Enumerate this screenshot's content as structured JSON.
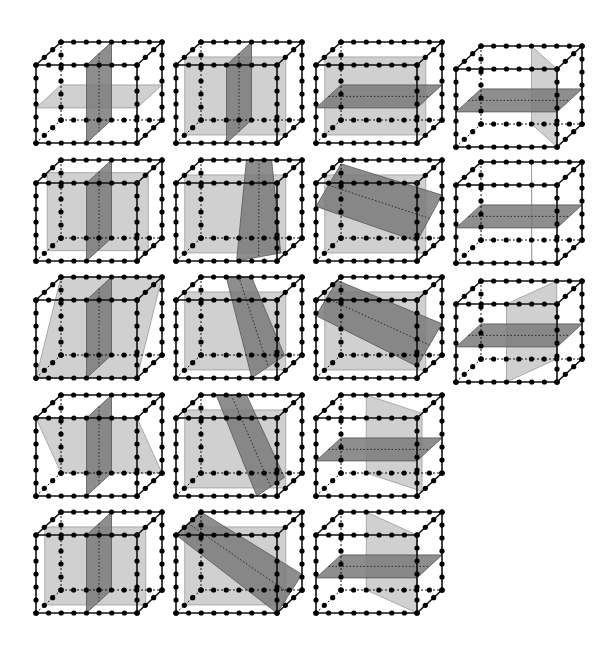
{
  "figure": {
    "colors": {
      "edge": "#111111",
      "bead": "#000000",
      "light_plane": "#c8c8c8",
      "dark_plane": "#7a7a7a",
      "background": "#ffffff"
    },
    "cube_geometry": {
      "front_width": 101,
      "front_height": 78,
      "depth_dx": 25,
      "depth_dy": -23,
      "beads_per_front_horizontal_edge": 9,
      "beads_per_vertical_edge": 7,
      "beads_per_depth_edge": 4
    },
    "cubes": [
      {
        "row": 0,
        "col": 0,
        "x": 36,
        "y": 65,
        "planes": [
          {
            "shade": "light",
            "pts": [
              [
                0,
                0.55,
                0
              ],
              [
                1,
                0.55,
                0
              ],
              [
                1,
                0.55,
                1
              ],
              [
                0,
                0.55,
                1
              ]
            ]
          },
          {
            "shade": "dark",
            "pts": [
              [
                0.5,
                0,
                0
              ],
              [
                0.5,
                1,
                0
              ],
              [
                0.5,
                1,
                1
              ],
              [
                0.5,
                0,
                1
              ]
            ]
          }
        ]
      },
      {
        "row": 0,
        "col": 1,
        "x": 176,
        "y": 65,
        "planes": [
          {
            "shade": "light",
            "pts": [
              [
                0,
                0,
                0.35
              ],
              [
                1,
                0,
                0.35
              ],
              [
                1,
                1,
                0.35
              ],
              [
                0,
                1,
                0.35
              ]
            ]
          },
          {
            "shade": "dark",
            "pts": [
              [
                0.5,
                0,
                0
              ],
              [
                0.5,
                1,
                0
              ],
              [
                0.5,
                1,
                1
              ],
              [
                0.5,
                0,
                1
              ]
            ]
          }
        ]
      },
      {
        "row": 0,
        "col": 2,
        "x": 316,
        "y": 65,
        "planes": [
          {
            "shade": "light",
            "pts": [
              [
                0,
                0,
                0.35
              ],
              [
                1,
                0,
                0.35
              ],
              [
                1,
                1,
                0.35
              ],
              [
                0,
                1,
                0.35
              ]
            ]
          },
          {
            "shade": "dark",
            "pts": [
              [
                0,
                0.55,
                0
              ],
              [
                1,
                0.55,
                0
              ],
              [
                1,
                0.55,
                1
              ],
              [
                0,
                0.55,
                1
              ]
            ]
          }
        ]
      },
      {
        "row": 0,
        "col": 3,
        "x": 456,
        "y": 69,
        "planes": [
          {
            "shade": "light",
            "pts": [
              [
                0.5,
                0,
                1
              ],
              [
                1,
                0,
                0
              ],
              [
                1,
                1,
                0
              ],
              [
                0.5,
                1,
                1
              ]
            ]
          },
          {
            "shade": "dark",
            "pts": [
              [
                0,
                0.55,
                0
              ],
              [
                1,
                0.55,
                0
              ],
              [
                1,
                0.55,
                1
              ],
              [
                0,
                0.55,
                1
              ]
            ]
          }
        ]
      },
      {
        "row": 1,
        "col": 0,
        "x": 36,
        "y": 183,
        "planes": [
          {
            "shade": "light",
            "pts": [
              [
                0,
                0,
                0.45
              ],
              [
                1,
                0,
                0.45
              ],
              [
                1,
                1,
                0.45
              ],
              [
                0,
                1,
                0.45
              ]
            ],
            "skew": "floor"
          },
          {
            "shade": "dark",
            "pts": [
              [
                0.5,
                0,
                0
              ],
              [
                0.5,
                1,
                0
              ],
              [
                0.5,
                1,
                1
              ],
              [
                0.5,
                0,
                1
              ]
            ]
          }
        ]
      },
      {
        "row": 1,
        "col": 1,
        "x": 176,
        "y": 183,
        "planes": [
          {
            "shade": "light",
            "pts": [
              [
                0,
                0,
                0.35
              ],
              [
                1,
                0,
                0.35
              ],
              [
                1,
                1,
                0.35
              ],
              [
                0,
                1,
                0.35
              ]
            ]
          },
          {
            "shade": "dark",
            "pts": [
              [
                0.45,
                0,
                1
              ],
              [
                0.6,
                1,
                0
              ],
              [
                0.95,
                1,
                0.35
              ],
              [
                0.7,
                0,
                1
              ]
            ]
          }
        ]
      },
      {
        "row": 1,
        "col": 2,
        "x": 316,
        "y": 183,
        "planes": [
          {
            "shade": "light",
            "pts": [
              [
                0,
                0,
                0.35
              ],
              [
                1,
                0,
                0.35
              ],
              [
                1,
                1,
                0.35
              ],
              [
                0,
                1,
                0.35
              ]
            ]
          },
          {
            "shade": "dark",
            "pts": [
              [
                0,
                0.3,
                0
              ],
              [
                1,
                0.75,
                0
              ],
              [
                1,
                0.45,
                1
              ],
              [
                0,
                0.05,
                1
              ]
            ]
          }
        ]
      },
      {
        "row": 1,
        "col": 3,
        "x": 456,
        "y": 185,
        "planes": [
          {
            "shade": "light",
            "pts": [
              [
                0.5,
                0,
                1
              ],
              [
                0.75,
                0,
                0
              ],
              [
                0.75,
                1,
                0
              ],
              [
                0.5,
                1,
                1
              ]
            ]
          },
          {
            "shade": "dark",
            "pts": [
              [
                0,
                0.55,
                0
              ],
              [
                1,
                0.55,
                0
              ],
              [
                1,
                0.55,
                1
              ],
              [
                0,
                0.55,
                1
              ]
            ]
          }
        ]
      },
      {
        "row": 2,
        "col": 0,
        "x": 36,
        "y": 300,
        "planes": [
          {
            "shade": "light",
            "pts": [
              [
                0,
                1,
                0
              ],
              [
                1,
                1,
                0
              ],
              [
                1,
                0,
                1
              ],
              [
                0,
                0,
                1
              ]
            ]
          },
          {
            "shade": "dark",
            "pts": [
              [
                0.5,
                0,
                0
              ],
              [
                0.5,
                1,
                0
              ],
              [
                0.5,
                1,
                1
              ],
              [
                0.5,
                0,
                1
              ]
            ]
          }
        ]
      },
      {
        "row": 2,
        "col": 1,
        "x": 176,
        "y": 300,
        "planes": [
          {
            "shade": "light",
            "pts": [
              [
                0,
                0,
                0.35
              ],
              [
                1,
                0,
                0.35
              ],
              [
                1,
                1,
                0.35
              ],
              [
                0,
                1,
                0.35
              ]
            ]
          },
          {
            "shade": "dark",
            "pts": [
              [
                0.25,
                0,
                1
              ],
              [
                0.75,
                1,
                0
              ],
              [
                1,
                0.8,
                0.3
              ],
              [
                0.5,
                0,
                1
              ]
            ]
          }
        ]
      },
      {
        "row": 2,
        "col": 2,
        "x": 316,
        "y": 300,
        "planes": [
          {
            "shade": "light",
            "pts": [
              [
                0,
                0,
                0.35
              ],
              [
                1,
                0,
                0.35
              ],
              [
                1,
                1,
                0.35
              ],
              [
                0,
                1,
                0.35
              ]
            ]
          },
          {
            "shade": "dark",
            "pts": [
              [
                0,
                0.2,
                0
              ],
              [
                1,
                0.85,
                0
              ],
              [
                1,
                0.6,
                1
              ],
              [
                0,
                0,
                0.85
              ]
            ]
          }
        ]
      },
      {
        "row": 2,
        "col": 3,
        "x": 456,
        "y": 304,
        "planes": [
          {
            "shade": "light",
            "pts": [
              [
                0.5,
                0,
                0
              ],
              [
                0.5,
                1,
                0
              ],
              [
                0.75,
                1,
                1
              ],
              [
                0.75,
                0,
                1
              ]
            ],
            "skew": "twist"
          },
          {
            "shade": "dark",
            "pts": [
              [
                0,
                0.55,
                0
              ],
              [
                1,
                0.55,
                0
              ],
              [
                1,
                0.55,
                1
              ],
              [
                0,
                0.55,
                1
              ]
            ]
          }
        ]
      },
      {
        "row": 3,
        "col": 0,
        "x": 36,
        "y": 418,
        "planes": [
          {
            "shade": "light",
            "pts": [
              [
                0,
                0,
                0
              ],
              [
                1,
                0,
                0
              ],
              [
                1,
                1,
                1
              ],
              [
                0,
                1,
                1
              ]
            ]
          },
          {
            "shade": "dark",
            "pts": [
              [
                0.5,
                0,
                0
              ],
              [
                0.5,
                1,
                0
              ],
              [
                0.5,
                1,
                1
              ],
              [
                0.5,
                0,
                1
              ]
            ]
          }
        ]
      },
      {
        "row": 3,
        "col": 1,
        "x": 176,
        "y": 418,
        "planes": [
          {
            "shade": "light",
            "pts": [
              [
                0,
                0,
                0.35
              ],
              [
                1,
                0,
                0.35
              ],
              [
                1,
                1,
                0.35
              ],
              [
                0,
                1,
                0.35
              ]
            ]
          },
          {
            "shade": "dark",
            "pts": [
              [
                0.15,
                0,
                1
              ],
              [
                0.8,
                1,
                0
              ],
              [
                1,
                0.85,
                0.3
              ],
              [
                0.45,
                0,
                1
              ]
            ]
          }
        ]
      },
      {
        "row": 3,
        "col": 2,
        "x": 316,
        "y": 418,
        "planes": [
          {
            "shade": "light",
            "pts": [
              [
                0.25,
                0,
                1
              ],
              [
                1,
                0,
                0.2
              ],
              [
                1,
                1,
                0.2
              ],
              [
                0.25,
                1,
                1
              ]
            ],
            "skew": "twist"
          },
          {
            "shade": "dark",
            "pts": [
              [
                0,
                0.55,
                0
              ],
              [
                1,
                0.55,
                0
              ],
              [
                1,
                0.55,
                1
              ],
              [
                0,
                0.55,
                1
              ]
            ]
          }
        ]
      },
      {
        "row": 4,
        "col": 0,
        "x": 36,
        "y": 535,
        "planes": [
          {
            "shade": "light",
            "pts": [
              [
                0,
                0,
                0.35
              ],
              [
                1,
                0,
                0.35
              ],
              [
                1,
                1,
                0.35
              ],
              [
                0,
                1,
                0.35
              ]
            ],
            "skew": "slant"
          },
          {
            "shade": "dark",
            "pts": [
              [
                0.5,
                0,
                0
              ],
              [
                0.5,
                1,
                0
              ],
              [
                0.5,
                1,
                1
              ],
              [
                0.5,
                0,
                1
              ]
            ]
          }
        ]
      },
      {
        "row": 4,
        "col": 1,
        "x": 176,
        "y": 535,
        "planes": [
          {
            "shade": "light",
            "pts": [
              [
                0,
                0,
                0.35
              ],
              [
                1,
                0,
                0.35
              ],
              [
                1,
                1,
                0.35
              ],
              [
                0,
                1,
                0.35
              ]
            ]
          },
          {
            "shade": "dark",
            "pts": [
              [
                0,
                0,
                0
              ],
              [
                1,
                1,
                0
              ],
              [
                1,
                0.8,
                1
              ],
              [
                0,
                0,
                1
              ]
            ]
          }
        ]
      },
      {
        "row": 4,
        "col": 2,
        "x": 316,
        "y": 535,
        "planes": [
          {
            "shade": "light",
            "pts": [
              [
                0.25,
                0,
                1
              ],
              [
                1,
                0,
                0
              ],
              [
                1,
                1,
                0
              ],
              [
                0.25,
                1,
                1
              ]
            ],
            "skew": "twist"
          },
          {
            "shade": "dark",
            "pts": [
              [
                0,
                0.55,
                0
              ],
              [
                1,
                0.55,
                0
              ],
              [
                1,
                0.55,
                1
              ],
              [
                0,
                0.55,
                1
              ]
            ]
          }
        ]
      }
    ]
  }
}
